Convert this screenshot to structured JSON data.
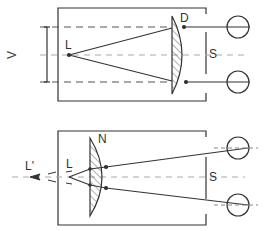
{
  "diagram": {
    "colors": {
      "stroke": "#333333",
      "dash": "#888888",
      "background": "#ffffff"
    },
    "top_panel": {
      "labels": {
        "lamp": "L",
        "lens": "D",
        "screen": "S",
        "spread": "V"
      }
    },
    "bottom_panel": {
      "labels": {
        "lamp": "L",
        "virtual_lamp": "L'",
        "lens": "N",
        "screen": "S"
      }
    }
  }
}
